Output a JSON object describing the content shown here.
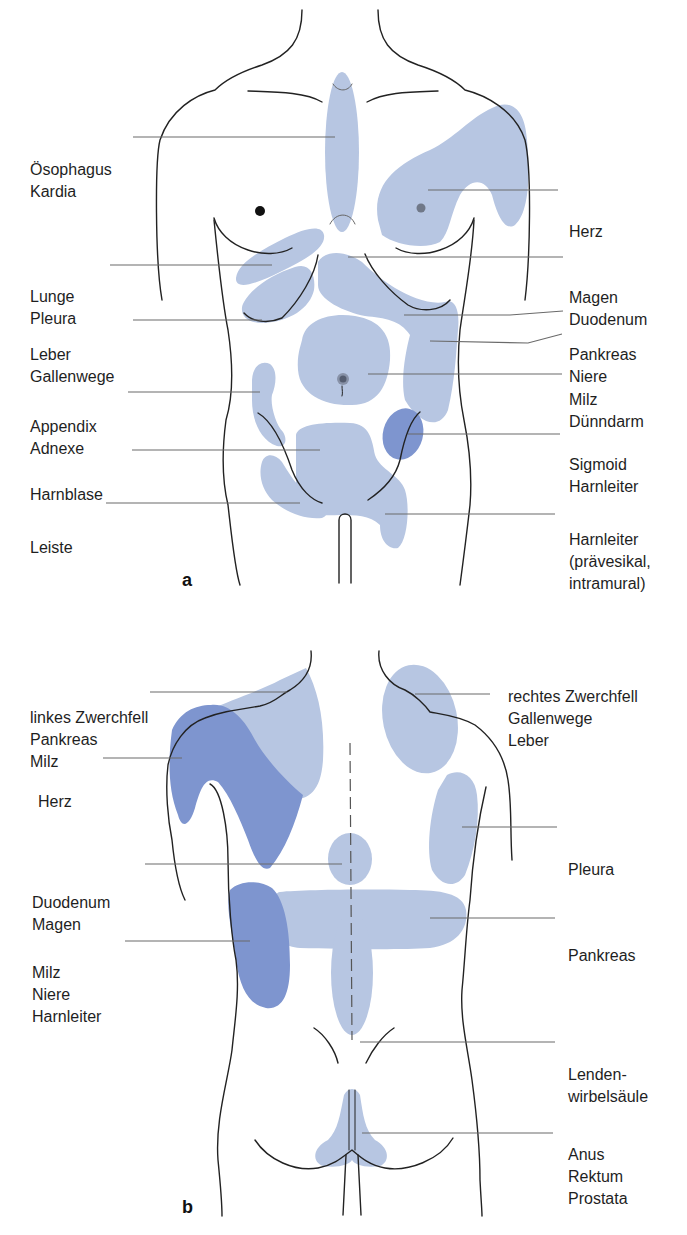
{
  "figure": {
    "panels": [
      {
        "id": "a",
        "view": "front",
        "letter": "a",
        "labels": [
          {
            "key": "oesophagus",
            "lines": [
              "Ösophagus",
              "Kardia"
            ],
            "side": "left"
          },
          {
            "key": "lunge",
            "lines": [
              "Lunge",
              "Pleura"
            ],
            "side": "left"
          },
          {
            "key": "leber",
            "lines": [
              "Leber",
              "Gallenwege"
            ],
            "side": "left"
          },
          {
            "key": "appendix",
            "lines": [
              "Appendix",
              "Adnexe"
            ],
            "side": "left"
          },
          {
            "key": "harnblase",
            "lines": [
              "Harnblase"
            ],
            "side": "left"
          },
          {
            "key": "leiste",
            "lines": [
              "Leiste"
            ],
            "side": "left"
          },
          {
            "key": "herz",
            "lines": [
              "Herz"
            ],
            "side": "right"
          },
          {
            "key": "magen",
            "lines": [
              "Magen",
              "Duodenum"
            ],
            "side": "right"
          },
          {
            "key": "pankreas",
            "lines": [
              "Pankreas",
              "Niere"
            ],
            "side": "right"
          },
          {
            "key": "duenndarm",
            "lines": [
              "Milz",
              "Dünndarm"
            ],
            "side": "right"
          },
          {
            "key": "sigmoid",
            "lines": [
              "Sigmoid",
              "Harnleiter"
            ],
            "side": "right"
          },
          {
            "key": "harnleiter",
            "lines": [
              "Harnleiter",
              "(prävesikal,",
              "intramural)"
            ],
            "side": "right"
          }
        ]
      },
      {
        "id": "b",
        "view": "back",
        "letter": "b",
        "labels": [
          {
            "key": "zwerchfell_links",
            "lines": [
              "linkes Zwerchfell",
              "Pankreas",
              "Milz"
            ],
            "side": "left"
          },
          {
            "key": "herz",
            "lines": [
              "Herz"
            ],
            "side": "left"
          },
          {
            "key": "duodenum",
            "lines": [
              "Duodenum",
              "Magen"
            ],
            "side": "left"
          },
          {
            "key": "milz",
            "lines": [
              "Milz",
              "Niere",
              "Harnleiter"
            ],
            "side": "left"
          },
          {
            "key": "zwerchfell_rechts",
            "lines": [
              "rechtes Zwerchfell",
              "Gallenwege",
              "Leber"
            ],
            "side": "right"
          },
          {
            "key": "pleura",
            "lines": [
              "Pleura"
            ],
            "side": "right"
          },
          {
            "key": "pankreas",
            "lines": [
              "Pankreas"
            ],
            "side": "right"
          },
          {
            "key": "lws",
            "lines": [
              "Lenden-",
              "wirbelsäule"
            ],
            "side": "right"
          },
          {
            "key": "anus",
            "lines": [
              "Anus",
              "Rektum",
              "Prostata"
            ],
            "side": "right"
          }
        ]
      }
    ],
    "colors": {
      "light_zone": "#b7c6e2",
      "dark_zone": "#7e95cf",
      "outline": "#222222",
      "leader": "#6a6a6a"
    }
  }
}
